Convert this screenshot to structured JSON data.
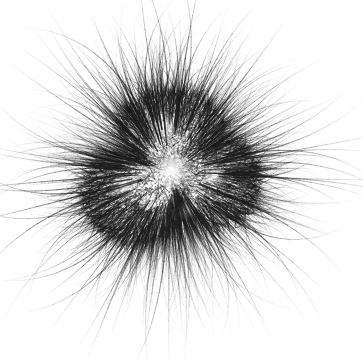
{
  "figure": {
    "name": "specimen-micrograph",
    "width": 363,
    "height": 361,
    "background_color": "#ffffff",
    "ink_color": "#2a2a2a",
    "rendering": "grayscale line drawing / micrograph"
  },
  "composition": {
    "center_x": 170,
    "center_y": 172,
    "core_radius_x": 85,
    "core_radius_y": 72,
    "filament_max_reach": 178,
    "filament_min_reach": 86,
    "filament_count": 1500,
    "core_stipple_count": 9000,
    "core_tangle_count": 2600
  },
  "lobes": [
    {
      "name": "top-center-lobe",
      "cx": 172,
      "cy": 131,
      "rx": 53,
      "ry": 40,
      "density": 0.9
    },
    {
      "name": "lower-left-lobe",
      "cx": 136,
      "cy": 196,
      "rx": 54,
      "ry": 47,
      "density": 1.0
    },
    {
      "name": "right-lobe",
      "cx": 215,
      "cy": 181,
      "rx": 45,
      "ry": 45,
      "density": 0.92
    }
  ],
  "highlights": [
    {
      "name": "central-vacuole-highlight",
      "cx": 172,
      "cy": 170,
      "r": 17
    },
    {
      "name": "upper-highlight",
      "cx": 163,
      "cy": 128,
      "r": 12
    },
    {
      "name": "left-highlight",
      "cx": 125,
      "cy": 186,
      "r": 11
    },
    {
      "name": "right-highlight",
      "cx": 214,
      "cy": 176,
      "r": 9
    },
    {
      "name": "lower-highlight",
      "cx": 186,
      "cy": 210,
      "r": 8
    }
  ],
  "palette": {
    "background": "#ffffff",
    "core_dark": "#2b2b2b",
    "mid_gray": "#6b6b6b",
    "filament_tip": "#b8b8b8",
    "highlight": "#f2f2f2"
  },
  "scale_bar": {
    "visible": false,
    "label": ""
  },
  "caption": {
    "visible": false,
    "text": ""
  }
}
